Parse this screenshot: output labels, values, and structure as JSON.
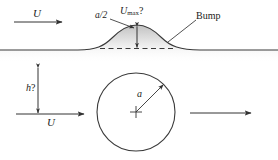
{
  "figure": {
    "background_color": "#ffffff",
    "line_color": "#333333",
    "shade_color": "#d8d8d8"
  },
  "labels": {
    "u_top": "U",
    "a_half": "a/2",
    "u_max_symbol": "U",
    "u_max_subscript": "max",
    "u_max_query": "?",
    "bump": "Bump",
    "h_symbol": "h",
    "h_query": "?",
    "u_bottom": "U",
    "radius": "a"
  },
  "geometry": {
    "wall_y": 50,
    "bump_peak_x": 137,
    "bump_peak_y": 25,
    "bump_left_x": 78,
    "bump_right_x": 200,
    "dashed_line_y": 48,
    "dashed_line_x1": 100,
    "dashed_line_x2": 176,
    "height_arrow_x": 137,
    "height_arrow_y1": 26,
    "height_arrow_y2": 48,
    "circle_center_x": 136,
    "circle_center_y": 112,
    "circle_radius": 39,
    "h_arrow_x": 38,
    "h_arrow_y1": 68,
    "h_arrow_y2": 113,
    "stream_top_y": 22,
    "stream_top_x1": 14,
    "stream_top_x2": 63,
    "stream_bottom_y": 114,
    "stream_bottom_x1": 16,
    "stream_bottom_x2": 85,
    "stream_out_y": 113,
    "stream_out_x1": 190,
    "stream_out_x2": 252,
    "radius_arrow_x1": 136,
    "radius_arrow_y1": 112,
    "radius_arrow_x2": 164,
    "radius_arrow_y2": 85
  }
}
